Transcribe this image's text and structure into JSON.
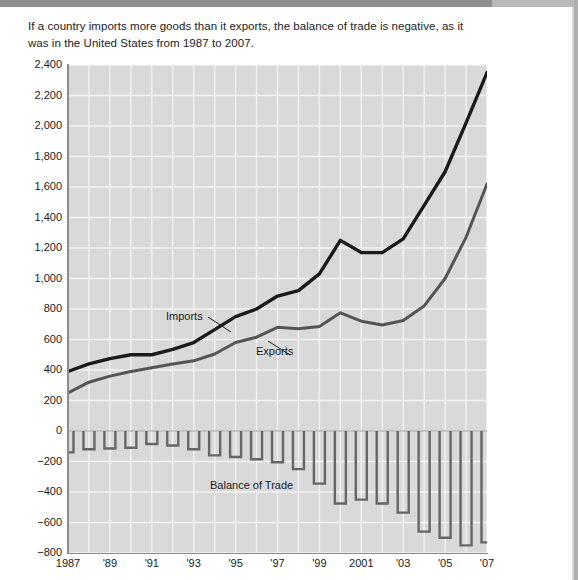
{
  "caption": "If a country imports more goods than it exports, the balance of trade is negative, as it was in the United States from 1987 to 2007.",
  "axis": {
    "y_title": "Billions of dollars",
    "y_ticks": [
      "2,400",
      "2,200",
      "2,000",
      "1,800",
      "1,600",
      "1,400",
      "1,200",
      "1,000",
      "800",
      "600",
      "400",
      "200",
      "0",
      "−200",
      "−400",
      "−600",
      "−800"
    ],
    "x_ticks": [
      "1987",
      "'89",
      "'91",
      "'93",
      "'95",
      "'97",
      "'99",
      "2001",
      "'03",
      "'05",
      "'07"
    ]
  },
  "labels": {
    "imports": "Imports",
    "exports": "Exports",
    "balance": "Balance of Trade"
  },
  "colors": {
    "plot_background": "#d9d9d9",
    "gridline": "#f2f2f2",
    "imports_line": "#1a1a1a",
    "exports_line": "#555555",
    "bar_outline": "#666666",
    "axis": "#8c8c8c",
    "text": "#1a1a1a"
  },
  "chart_data": {
    "type": "line",
    "title": "",
    "xlabel": "",
    "ylabel": "Billions of dollars",
    "ylim": [
      -800,
      2400
    ],
    "xlim": [
      1987,
      2007
    ],
    "ytick_step": 200,
    "grid": true,
    "legend": "inline-annotations",
    "x": [
      1987,
      1988,
      1989,
      1990,
      1991,
      1992,
      1993,
      1994,
      1995,
      1996,
      1997,
      1998,
      1999,
      2000,
      2001,
      2002,
      2003,
      2004,
      2005,
      2006,
      2007
    ],
    "series": [
      {
        "name": "Imports",
        "style": "line",
        "color": "#1a1a1a",
        "values": [
          390,
          440,
          475,
          500,
          500,
          535,
          580,
          665,
          750,
          800,
          885,
          920,
          1030,
          1250,
          1170,
          1170,
          1260,
          1480,
          1700,
          2020,
          2350
        ]
      },
      {
        "name": "Exports",
        "style": "line",
        "color": "#555555",
        "values": [
          250,
          320,
          360,
          390,
          415,
          440,
          460,
          505,
          580,
          615,
          680,
          670,
          685,
          775,
          720,
          695,
          725,
          820,
          1000,
          1270,
          1620
        ]
      },
      {
        "name": "Balance of Trade",
        "style": "bar",
        "color": "#666666",
        "values": [
          -140,
          -120,
          -115,
          -110,
          -85,
          -95,
          -120,
          -160,
          -170,
          -185,
          -205,
          -250,
          -345,
          -475,
          -450,
          -475,
          -535,
          -660,
          -700,
          -750,
          -730
        ]
      }
    ]
  }
}
